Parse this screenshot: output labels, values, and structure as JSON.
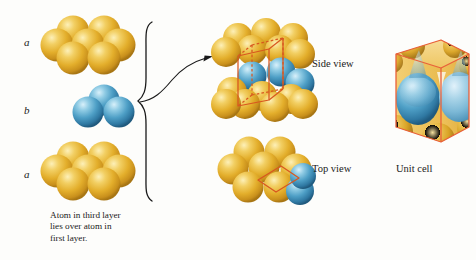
{
  "figure": {
    "background_color": "#fdfdfb"
  },
  "colors": {
    "gold_sphere": "#e8b52e",
    "gold_highlight": "#f8e49a",
    "gold_shadow": "#b8851a",
    "blue_sphere": "#4a9cc4",
    "blue_highlight": "#bfe3f2",
    "blue_shadow": "#2a6a8e",
    "cell_outline": "#d8571f",
    "unit_cell_face": "#f0c75e",
    "line_ink": "#1a1a1a"
  },
  "layers": [
    {
      "id": "layer-a-top",
      "label": "a",
      "color_role": "gold_sphere",
      "sphere_count": 7,
      "arrangement": "hexagonal"
    },
    {
      "id": "layer-b-middle",
      "label": "b",
      "color_role": "blue_sphere",
      "sphere_count": 3,
      "arrangement": "triangular"
    },
    {
      "id": "layer-a-bottom",
      "label": "a",
      "color_role": "gold_sphere",
      "sphere_count": 7,
      "arrangement": "hexagonal"
    }
  ],
  "caption": {
    "lines": [
      "Atom in third layer",
      "lies over atom in",
      "first layer."
    ],
    "full_text": "Atom in third layer lies over atom in first layer."
  },
  "views": [
    {
      "id": "side-view",
      "label": "Side view",
      "overlay_shape": "cube",
      "overlay_color": "#d8571f"
    },
    {
      "id": "top-view",
      "label": "Top view",
      "overlay_shape": "rhombus",
      "overlay_color": "#d8571f"
    },
    {
      "id": "unit-cell",
      "label": "Unit cell",
      "overlay_shape": "translucent-cube",
      "overlay_color": "#d8571f"
    }
  ],
  "annotations": {
    "brace": "left-curly-brace",
    "arrow": "curved-arrow-right"
  }
}
